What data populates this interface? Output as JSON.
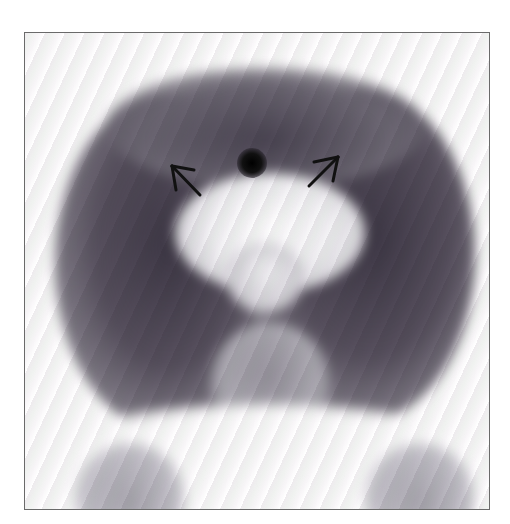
{
  "image": {
    "description": "Grayscale nuclear medicine scan (anterior view) with two arrows pointing at the bright central region",
    "frame_color": "#6a6a6a",
    "background": "#ffffff",
    "tissue_dark": "#4a4452",
    "tissue_mid": "#8c8892",
    "tissue_light": "#c8c6cc",
    "hot_spot": "#000000"
  },
  "annotations": {
    "arrows": [
      {
        "name": "left-arrow",
        "direction": "up-left",
        "tip": [
          170,
          164
        ],
        "tail": [
          200,
          195
        ]
      },
      {
        "name": "right-arrow",
        "direction": "up-right",
        "tip": [
          338,
          156
        ],
        "tail": [
          308,
          186
        ]
      }
    ],
    "hot_spot": {
      "center": [
        252,
        162
      ],
      "radius": 13
    }
  }
}
